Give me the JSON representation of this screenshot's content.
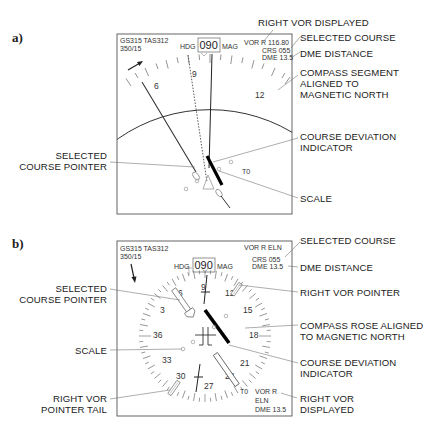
{
  "panel_a": {
    "label": "a)",
    "display": {
      "top_left_line1": "GS315 TAS312",
      "top_left_line2": "350/15",
      "hdg_label": "HDG",
      "hdg_value": "090",
      "mag_label": "MAG",
      "vor_line": "VOR R 116.80",
      "crs_line": "CRS 055",
      "dme_line": "DME 13.5",
      "scale_labels": [
        "6",
        "9",
        "12"
      ],
      "to_from": "T0"
    },
    "callouts": {
      "right_vor_displayed": "RIGHT VOR DISPLAYED",
      "selected_course": "SELECTED COURSE",
      "dme_distance": "DME DISTANCE",
      "compass_segment_1": "COMPASS SEGMENT",
      "compass_segment_2": "ALIGNED TO",
      "compass_segment_3": "MAGNETIC NORTH",
      "selected_course_pointer_1": "SELECTED",
      "selected_course_pointer_2": "COURSE POINTER",
      "course_deviation_indicator_1": "COURSE DEVIATION",
      "course_deviation_indicator_2": "INDICATOR",
      "scale": "SCALE"
    }
  },
  "panel_b": {
    "label": "b)",
    "display": {
      "top_left_line1": "GS315 TAS312",
      "top_left_line2": "350/15",
      "hdg_label": "HDG",
      "hdg_value": "090",
      "mag_label": "MAG",
      "vor_line": "VOR R ELN",
      "crs_line": "CRS 055",
      "dme_line": "DME 13.5",
      "rose_labels": [
        "9",
        "12",
        "15",
        "18",
        "21",
        "24",
        "27",
        "30",
        "33",
        "36",
        "3",
        "6"
      ],
      "to_from": "T0",
      "bottom_vor_line1": "VOR R",
      "bottom_vor_line2": "ELN",
      "bottom_vor_line3": "DME 13.5"
    },
    "callouts": {
      "selected_course": "SELECTED COURSE",
      "dme_distance": "DME DISTANCE",
      "selected_course_pointer_1": "SELECTED",
      "selected_course_pointer_2": "COURSE POINTER",
      "right_vor_pointer": "RIGHT VOR POINTER",
      "compass_rose_1": "COMPASS ROSE ALIGNED",
      "compass_rose_2": "TO MAGNETIC NORTH",
      "scale": "SCALE",
      "course_deviation_indicator_1": "COURSE DEVIATION",
      "course_deviation_indicator_2": "INDICATOR",
      "right_vor_pointer_tail_1": "RIGHT VOR",
      "right_vor_pointer_tail_2": "POINTER TAIL",
      "right_vor_displayed_1": "RIGHT VOR",
      "right_vor_displayed_2": "DISPLAYED"
    }
  }
}
